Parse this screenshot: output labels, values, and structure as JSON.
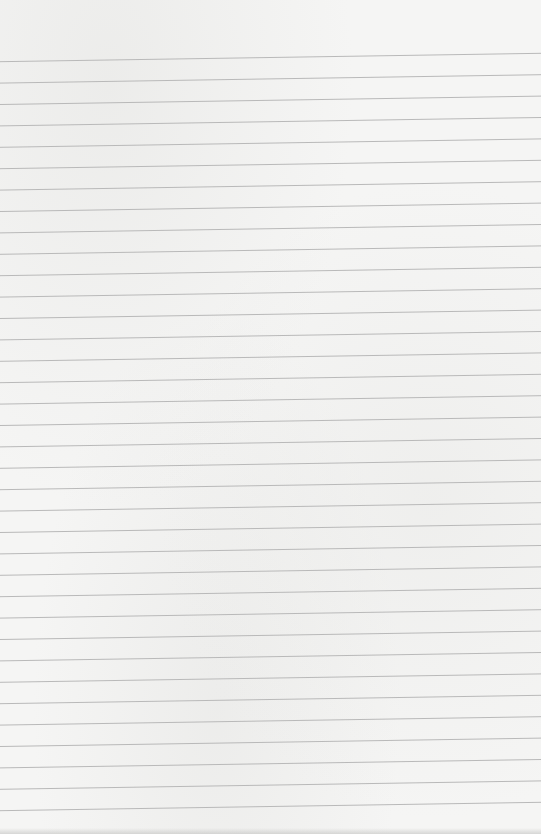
{
  "paper": {
    "type": "lined-paper",
    "background_color": "#f5f5f4",
    "line_color": "#b9b9b9",
    "line_count": 36,
    "first_line_y_left": 61.7,
    "first_line_y_right": 53.3,
    "line_spacing": 21.4,
    "width": 541,
    "height": 834
  }
}
